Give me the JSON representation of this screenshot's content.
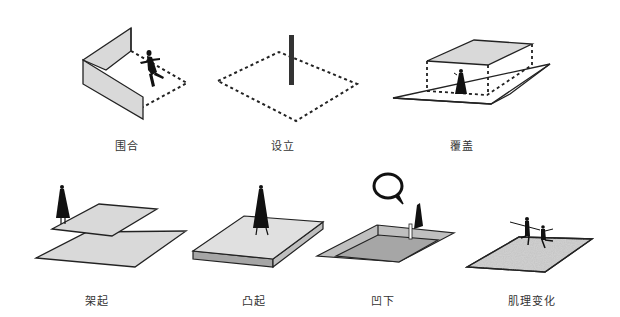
{
  "diagram": {
    "panels": [
      {
        "id": "enclose",
        "label": "围合",
        "x": 127,
        "y": 137
      },
      {
        "id": "set-up",
        "label": "设立",
        "x": 283,
        "y": 137
      },
      {
        "id": "cover",
        "label": "覆盖",
        "x": 462,
        "y": 137
      },
      {
        "id": "elevate",
        "label": "架起",
        "x": 97,
        "y": 292
      },
      {
        "id": "raise",
        "label": "凸起",
        "x": 254,
        "y": 292
      },
      {
        "id": "sink",
        "label": "凹下",
        "x": 383,
        "y": 292
      },
      {
        "id": "texture",
        "label": "肌理变化",
        "x": 532,
        "y": 292
      }
    ],
    "colors": {
      "fill_gray": "#d9d9d9",
      "dark_gray": "#a6a6a6",
      "stroke": "#222222",
      "figure": "#111111"
    }
  }
}
